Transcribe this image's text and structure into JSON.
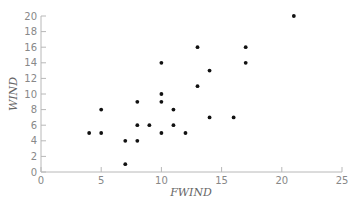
{
  "chart_data": {
    "type": "scatter",
    "title": "",
    "xlabel": "FWIND",
    "ylabel": "WIND",
    "xlim": [
      0,
      25
    ],
    "ylim": [
      0,
      20
    ],
    "xticks": [
      0,
      5,
      10,
      15,
      20,
      25
    ],
    "yticks": [
      0,
      2,
      4,
      6,
      8,
      10,
      12,
      14,
      16,
      18,
      20
    ],
    "grid": false,
    "legend": null,
    "points": [
      {
        "x": 4,
        "y": 5
      },
      {
        "x": 5,
        "y": 8
      },
      {
        "x": 5,
        "y": 5
      },
      {
        "x": 7,
        "y": 4
      },
      {
        "x": 7,
        "y": 1
      },
      {
        "x": 8,
        "y": 9
      },
      {
        "x": 8,
        "y": 6
      },
      {
        "x": 8,
        "y": 4
      },
      {
        "x": 9,
        "y": 6
      },
      {
        "x": 10,
        "y": 14
      },
      {
        "x": 10,
        "y": 10
      },
      {
        "x": 10,
        "y": 9
      },
      {
        "x": 10,
        "y": 5
      },
      {
        "x": 11,
        "y": 8
      },
      {
        "x": 11,
        "y": 6
      },
      {
        "x": 12,
        "y": 5
      },
      {
        "x": 13,
        "y": 16
      },
      {
        "x": 13,
        "y": 11
      },
      {
        "x": 14,
        "y": 13
      },
      {
        "x": 14,
        "y": 7
      },
      {
        "x": 16,
        "y": 7
      },
      {
        "x": 17,
        "y": 16
      },
      {
        "x": 17,
        "y": 14
      },
      {
        "x": 21,
        "y": 20
      }
    ]
  }
}
